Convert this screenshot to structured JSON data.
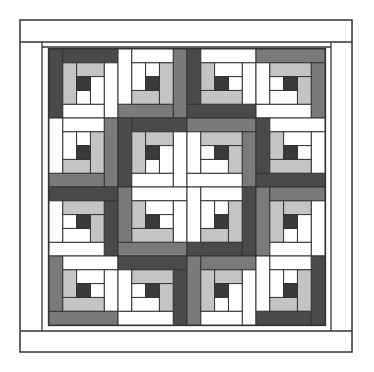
{
  "diagram": {
    "title": "",
    "type": "log-cabin-quilt",
    "grid": {
      "rows": 4,
      "cols": 4,
      "units_per_block": 5
    },
    "colors": {
      "white": "#ffffff",
      "light": "#c4c4c4",
      "medium": "#7a7a7a",
      "dark": "#4a4a4a",
      "center": "#3a3a3a",
      "line": "#333333"
    },
    "frame": {
      "outer": {
        "x": 20,
        "y": 20,
        "w": 332,
        "h": 332
      },
      "top_band_line_y": 42,
      "left_band_line_x": 42,
      "right_band_line_x": 331,
      "bottom_band_line_y": 331,
      "inner_strip_top_y": 47,
      "blocks_origin": {
        "x": 49,
        "y": 49
      },
      "block_size": 69
    },
    "blocks": [
      [
        {
          "corner": "TL",
          "outer": "dark"
        },
        {
          "corner": "BR",
          "outer": "medium"
        },
        {
          "corner": "BL",
          "outer": "dark"
        },
        {
          "corner": "TR",
          "outer": "medium"
        }
      ],
      [
        {
          "corner": "BR",
          "outer": "medium"
        },
        {
          "corner": "TL",
          "outer": "dark"
        },
        {
          "corner": "TR",
          "outer": "medium"
        },
        {
          "corner": "BL",
          "outer": "dark"
        }
      ],
      [
        {
          "corner": "TR",
          "outer": "dark"
        },
        {
          "corner": "BL",
          "outer": "medium"
        },
        {
          "corner": "BR",
          "outer": "dark"
        },
        {
          "corner": "TL",
          "outer": "medium"
        }
      ],
      [
        {
          "corner": "BL",
          "outer": "medium"
        },
        {
          "corner": "TR",
          "outer": "dark"
        },
        {
          "corner": "TL",
          "outer": "medium"
        },
        {
          "corner": "BR",
          "outer": "dark"
        }
      ]
    ]
  }
}
